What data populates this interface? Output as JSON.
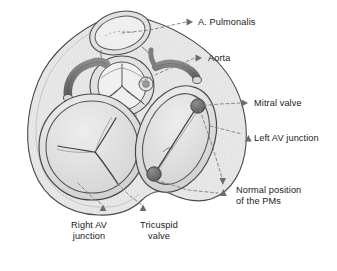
{
  "figure": {
    "kind": "anatomical-diagram",
    "background_color": "#ffffff",
    "ink_color": "#1a1a1a"
  },
  "palette": {
    "outline": "#4a4a4a",
    "myocardium_fill": "#e8e8e8",
    "chamber_fill": "#dedede",
    "valve_ring_fill": "#d6d6d6",
    "coronary_fill": "#6d6d6d",
    "papillary_fill": "#6f6f6f",
    "leader_line": "#7a7a7a",
    "arrow_fill": "#6b6b6b",
    "text": "#1a1a1a"
  },
  "labels": [
    {
      "id": "a-pulmonalis",
      "text": "A. Pulmonalis",
      "x": 198,
      "y": 17,
      "align": "left",
      "arrow": {
        "x": 188,
        "y": 22,
        "direction": "right"
      }
    },
    {
      "id": "aorta",
      "text": "Aorta",
      "x": 208,
      "y": 53,
      "align": "left",
      "arrow": {
        "x": 197,
        "y": 58,
        "direction": "right"
      }
    },
    {
      "id": "mitral-valve",
      "text": "Mitral valve",
      "x": 254,
      "y": 98,
      "align": "left",
      "arrow": {
        "x": 243,
        "y": 103,
        "direction": "right"
      }
    },
    {
      "id": "left-av-junction",
      "text": "Left AV junction",
      "x": 254,
      "y": 133,
      "align": "left",
      "arrow": {
        "x": 243,
        "y": 139,
        "direction": "up"
      }
    },
    {
      "id": "normal-position-pms",
      "text": "Normal position\nof the PMs",
      "x": 236,
      "y": 188,
      "align": "left",
      "arrow": {
        "x": 225,
        "y": 190,
        "direction": "up"
      }
    },
    {
      "id": "right-av-junction",
      "text": "Right AV\njunction",
      "x": 83,
      "y": 223,
      "align": "center",
      "arrow": {
        "x": 103,
        "y": 210,
        "direction": "up"
      }
    },
    {
      "id": "tricuspid-valve",
      "text": "Tricuspid\nvalve",
      "x": 155,
      "y": 223,
      "align": "center",
      "arrow": {
        "x": 143,
        "y": 210,
        "direction": "up"
      }
    }
  ],
  "structures": [
    {
      "id": "heart-silhouette",
      "name": "heart outer wall / epicardial silhouette"
    },
    {
      "id": "pulmonary-artery",
      "name": "pulmonary artery (A. Pulmonalis) orifice"
    },
    {
      "id": "aortic-valve",
      "name": "aortic valve with three cusps"
    },
    {
      "id": "right-coronary-artery",
      "name": "right coronary artery"
    },
    {
      "id": "left-coronary-artery",
      "name": "left coronary artery"
    },
    {
      "id": "tricuspid-valve-ring",
      "name": "tricuspid valve annulus with three leaflets"
    },
    {
      "id": "mitral-valve-ring",
      "name": "mitral valve annulus with two leaflets"
    },
    {
      "id": "papillary-muscle-anterolateral",
      "name": "anterolateral papillary muscle"
    },
    {
      "id": "papillary-muscle-posteromedial",
      "name": "posteromedial papillary muscle"
    },
    {
      "id": "coronary-sinus-ostium",
      "name": "small coronary ostium near aortic root"
    }
  ]
}
